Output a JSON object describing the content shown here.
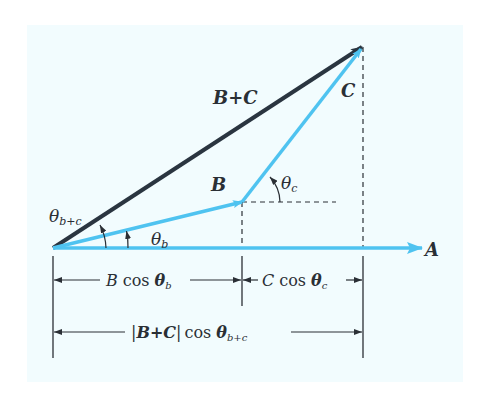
{
  "figure": {
    "colors": {
      "background": "#f2fcfe",
      "vector_blue": "#4fc3f0",
      "vector_dark": "#2a3540",
      "line": "#2a2f35"
    },
    "vectors": [
      {
        "name": "A",
        "label": "A",
        "from": [
          53,
          248
        ],
        "to": [
          422,
          248
        ],
        "color": "blue"
      },
      {
        "name": "B",
        "label": "B",
        "from": [
          53,
          248
        ],
        "to": [
          242,
          202
        ],
        "color": "blue"
      },
      {
        "name": "C",
        "label": "C",
        "from": [
          242,
          202
        ],
        "to": [
          362,
          47
        ],
        "color": "blue"
      },
      {
        "name": "B+C",
        "label": "B+C",
        "from": [
          53,
          248
        ],
        "to": [
          362,
          47
        ],
        "color": "dark"
      }
    ],
    "angles": [
      {
        "name": "theta_b",
        "symbol": "θ",
        "subscript": "b"
      },
      {
        "name": "theta_c",
        "symbol": "θ",
        "subscript": "c"
      },
      {
        "name": "theta_b_plus_c",
        "symbol": "θ",
        "subscript": "b+c"
      }
    ],
    "dimensions": [
      {
        "name": "B cos theta_b",
        "prefix": "B",
        "func": "cos",
        "symbol": "θ",
        "subscript": "b"
      },
      {
        "name": "C cos theta_c",
        "prefix": "C",
        "func": "cos",
        "symbol": "θ",
        "subscript": "c"
      },
      {
        "name": "|B+C| cos theta_b+c",
        "prefix": "|B+C|",
        "func": "cos",
        "symbol": "θ",
        "subscript": "b+c"
      }
    ]
  },
  "labels": {
    "vec_a": "A",
    "vec_b": "B",
    "vec_c": "C",
    "vec_sum": "B+C",
    "theta": "θ",
    "sub_b": "b",
    "sub_c": "c",
    "sub_bc": "b+c",
    "cos": "cos",
    "dim1_prefix": "B",
    "dim2_prefix": "C",
    "dim3_bar_open": "|",
    "dim3_vec": "B+C",
    "dim3_bar_close": "|"
  }
}
